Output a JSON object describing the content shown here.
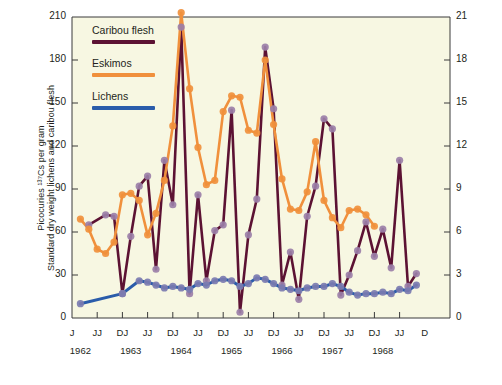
{
  "axes": {
    "left_title_line1": "Picocuries ¹³⁷Cs per gram",
    "left_title_line2": "Standard dry weight lichens and caribou flesh",
    "right_title": "Nanocuries ¹³⁷Cs per kilogram body weight Eskimos",
    "left_ticks": [
      "0",
      "30",
      "60",
      "90",
      "120",
      "150",
      "180",
      "210"
    ],
    "right_ticks": [
      "0",
      "3",
      "6",
      "9",
      "12",
      "15",
      "18",
      "21"
    ],
    "x_ticks": [
      "J",
      "JJ",
      "DJ",
      "JJ",
      "DJ",
      "JJ",
      "DJ",
      "JJ",
      "DJ",
      "JJ",
      "DJ",
      "JJ",
      "DJ",
      "JJ",
      "D"
    ],
    "x_years": [
      "1962",
      "1963",
      "1964",
      "1965",
      "1966",
      "1967",
      "1968"
    ]
  },
  "legend": {
    "items": [
      {
        "label": "Caribou flesh",
        "color": "#5c1233"
      },
      {
        "label": "Eskimos",
        "color": "#f0903c"
      },
      {
        "label": "Lichens",
        "color": "#2a5caa"
      }
    ]
  },
  "colors": {
    "plot_background": "#f7f7e2",
    "page_background": "#ffffff",
    "axis": "#3a3a3a",
    "marker_caribou": "#9b7fa8",
    "marker_eskimo": "#f0903c",
    "marker_lichen": "#7b7bb0",
    "text": "#231f20"
  },
  "chart_data": {
    "type": "line",
    "title": "",
    "xlabel": "",
    "ylabel": "Picocuries 137Cs per gram standard dry weight lichens and caribou flesh",
    "ylabel_right": "Nanocuries 137Cs per kilogram body weight Eskimos",
    "ylim": [
      0,
      210
    ],
    "ylim_right": [
      0,
      21
    ],
    "grid": false,
    "legend_position": "top-left",
    "x_tick_labels": [
      "J",
      "JJ",
      "DJ",
      "JJ",
      "DJ",
      "JJ",
      "DJ",
      "JJ",
      "DJ",
      "JJ",
      "DJ",
      "JJ",
      "DJ",
      "JJ",
      "D"
    ],
    "x_year_labels": [
      "1962",
      "1963",
      "1964",
      "1965",
      "1966",
      "1967",
      "1968"
    ],
    "x_index_range": [
      0,
      45
    ],
    "series": [
      {
        "name": "Caribou flesh",
        "color": "#5c1233",
        "marker_color": "#9b7fa8",
        "axis": "left",
        "points": [
          {
            "x": 2,
            "y": 65
          },
          {
            "x": 4,
            "y": 72
          },
          {
            "x": 5,
            "y": 71
          },
          {
            "x": 6,
            "y": 17
          },
          {
            "x": 7,
            "y": 57
          },
          {
            "x": 8,
            "y": 92
          },
          {
            "x": 9,
            "y": 99
          },
          {
            "x": 10,
            "y": 34
          },
          {
            "x": 11,
            "y": 110
          },
          {
            "x": 12,
            "y": 79
          },
          {
            "x": 13,
            "y": 203
          },
          {
            "x": 14,
            "y": 17
          },
          {
            "x": 15,
            "y": 86
          },
          {
            "x": 16,
            "y": 26
          },
          {
            "x": 17,
            "y": 61
          },
          {
            "x": 18,
            "y": 65
          },
          {
            "x": 19,
            "y": 145
          },
          {
            "x": 20,
            "y": 4
          },
          {
            "x": 21,
            "y": 58
          },
          {
            "x": 22,
            "y": 83
          },
          {
            "x": 23,
            "y": 189
          },
          {
            "x": 24,
            "y": 146
          },
          {
            "x": 25,
            "y": 23
          },
          {
            "x": 26,
            "y": 46
          },
          {
            "x": 27,
            "y": 13
          },
          {
            "x": 28,
            "y": 71
          },
          {
            "x": 29,
            "y": 92
          },
          {
            "x": 30,
            "y": 139
          },
          {
            "x": 31,
            "y": 132
          },
          {
            "x": 32,
            "y": 16
          },
          {
            "x": 33,
            "y": 30
          },
          {
            "x": 34,
            "y": 47
          },
          {
            "x": 35,
            "y": 67
          },
          {
            "x": 36,
            "y": 43
          },
          {
            "x": 37,
            "y": 62
          },
          {
            "x": 38,
            "y": 35
          },
          {
            "x": 39,
            "y": 110
          },
          {
            "x": 40,
            "y": 22
          },
          {
            "x": 41,
            "y": 31
          }
        ]
      },
      {
        "name": "Eskimos",
        "color": "#f0903c",
        "marker_color": "#f0903c",
        "axis": "right",
        "points": [
          {
            "x": 1,
            "y": 6.9
          },
          {
            "x": 2,
            "y": 6.2
          },
          {
            "x": 3,
            "y": 4.8
          },
          {
            "x": 4,
            "y": 4.5
          },
          {
            "x": 5,
            "y": 5.3
          },
          {
            "x": 6,
            "y": 8.6
          },
          {
            "x": 7,
            "y": 8.7
          },
          {
            "x": 8,
            "y": 8.2
          },
          {
            "x": 9,
            "y": 5.8
          },
          {
            "x": 10,
            "y": 7.3
          },
          {
            "x": 11,
            "y": 9.6
          },
          {
            "x": 12,
            "y": 13.4
          },
          {
            "x": 13,
            "y": 21.3
          },
          {
            "x": 14,
            "y": 16.0
          },
          {
            "x": 15,
            "y": 11.9
          },
          {
            "x": 16,
            "y": 9.3
          },
          {
            "x": 17,
            "y": 9.6
          },
          {
            "x": 18,
            "y": 14.4
          },
          {
            "x": 19,
            "y": 15.5
          },
          {
            "x": 20,
            "y": 15.4
          },
          {
            "x": 21,
            "y": 13.1
          },
          {
            "x": 22,
            "y": 12.9
          },
          {
            "x": 23,
            "y": 18.0
          },
          {
            "x": 24,
            "y": 13.5
          },
          {
            "x": 25,
            "y": 9.7
          },
          {
            "x": 26,
            "y": 7.6
          },
          {
            "x": 27,
            "y": 7.5
          },
          {
            "x": 28,
            "y": 8.8
          },
          {
            "x": 29,
            "y": 12.3
          },
          {
            "x": 30,
            "y": 8.2
          },
          {
            "x": 31,
            "y": 7.0
          },
          {
            "x": 32,
            "y": 6.3
          },
          {
            "x": 33,
            "y": 7.5
          },
          {
            "x": 34,
            "y": 7.6
          },
          {
            "x": 35,
            "y": 7.2
          },
          {
            "x": 36,
            "y": 6.4
          }
        ]
      },
      {
        "name": "Lichens",
        "color": "#2a5caa",
        "marker_color": "#7b7bb0",
        "axis": "left",
        "points": [
          {
            "x": 1,
            "y": 10
          },
          {
            "x": 6,
            "y": 17
          },
          {
            "x": 8,
            "y": 26
          },
          {
            "x": 9,
            "y": 25
          },
          {
            "x": 10,
            "y": 23
          },
          {
            "x": 11,
            "y": 21
          },
          {
            "x": 12,
            "y": 22
          },
          {
            "x": 13,
            "y": 21
          },
          {
            "x": 14,
            "y": 20
          },
          {
            "x": 15,
            "y": 24
          },
          {
            "x": 16,
            "y": 23
          },
          {
            "x": 17,
            "y": 26
          },
          {
            "x": 18,
            "y": 27
          },
          {
            "x": 19,
            "y": 26
          },
          {
            "x": 20,
            "y": 22
          },
          {
            "x": 21,
            "y": 24
          },
          {
            "x": 22,
            "y": 28
          },
          {
            "x": 23,
            "y": 27
          },
          {
            "x": 24,
            "y": 24
          },
          {
            "x": 25,
            "y": 21
          },
          {
            "x": 26,
            "y": 20
          },
          {
            "x": 27,
            "y": 19
          },
          {
            "x": 28,
            "y": 21
          },
          {
            "x": 29,
            "y": 22
          },
          {
            "x": 30,
            "y": 22
          },
          {
            "x": 31,
            "y": 24
          },
          {
            "x": 32,
            "y": 22
          },
          {
            "x": 33,
            "y": 18
          },
          {
            "x": 34,
            "y": 16
          },
          {
            "x": 35,
            "y": 17
          },
          {
            "x": 36,
            "y": 17
          },
          {
            "x": 37,
            "y": 18
          },
          {
            "x": 38,
            "y": 17
          },
          {
            "x": 39,
            "y": 20
          },
          {
            "x": 40,
            "y": 19
          },
          {
            "x": 41,
            "y": 23
          }
        ]
      }
    ]
  }
}
